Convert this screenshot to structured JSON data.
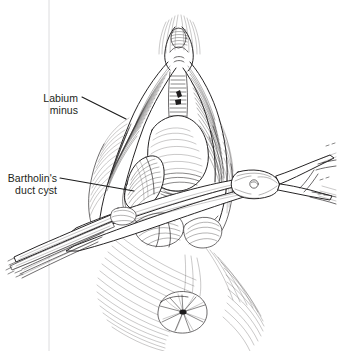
{
  "figure": {
    "type": "medical line illustration",
    "style": "pen-and-ink crosshatch engraving",
    "width": 337,
    "height": 351,
    "background_color": "#ffffff",
    "ink_color": "#1f1d1e",
    "label_color": "#231f20",
    "margin_rule_color": "#d8d8da"
  },
  "annotations": [
    {
      "id": "labium-minus",
      "lines": [
        "Labium",
        "minus"
      ],
      "line1": "Labium",
      "line2": "minus",
      "text_x": 78,
      "text_y": 102,
      "leader_start_x": 82,
      "leader_start_y": 97,
      "leader_end_x": 126,
      "leader_end_y": 119
    },
    {
      "id": "bartholins-duct-cyst",
      "lines": [
        "Bartholin's",
        "duct cyst"
      ],
      "line1": "Bartholin's",
      "line2": "duct cyst",
      "text_x": 57,
      "text_y": 182,
      "leader_start_x": 60,
      "leader_start_y": 178,
      "leader_end_x": 134,
      "leader_end_y": 191
    }
  ],
  "structures": [
    {
      "name": "labium-minus-left",
      "description": "left labium minus retracted"
    },
    {
      "name": "labium-minus-right",
      "description": "right labium minus retracted"
    },
    {
      "name": "clitoris",
      "description": "clitoral hood at apex"
    },
    {
      "name": "vestibule",
      "description": "central vestibular field"
    },
    {
      "name": "bartholin-duct-cyst",
      "description": "cystic mass at lower left vestibule"
    },
    {
      "name": "perineum",
      "description": "perineal body at lower field"
    },
    {
      "name": "anus",
      "description": "anal verge at base of field"
    }
  ],
  "instruments": [
    {
      "name": "surgical-scissors",
      "description": "straight surgical scissors with box joint and ring handles, crossing the field from lower-left to right",
      "hinge_x": 250,
      "hinge_y": 184
    },
    {
      "name": "retractor-forceps",
      "description": "slender forceps entering from lower left beneath the scissors"
    }
  ],
  "margin_rule": {
    "x": 49,
    "y_top": 0,
    "y_bottom": 351
  }
}
